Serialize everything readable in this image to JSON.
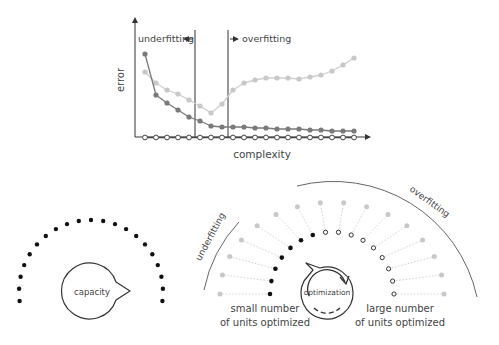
{
  "chart_data": {
    "type": "line",
    "title": "",
    "xlabel": "complexity",
    "ylabel": "error",
    "grid": false,
    "legend": null,
    "x": [
      1,
      2,
      3,
      4,
      5,
      6,
      7,
      8,
      9,
      10,
      11,
      12,
      13,
      14,
      15,
      16,
      17,
      18,
      19,
      20
    ],
    "series": [
      {
        "name": "training error (dark)",
        "color": "#7a7a7a",
        "values": [
          83,
          42,
          34,
          27,
          20,
          16,
          11,
          10,
          10,
          10,
          9,
          9,
          8,
          8,
          8,
          7,
          7,
          6,
          6,
          6
        ]
      },
      {
        "name": "validation error (light)",
        "color": "#c4c4c4",
        "values": [
          65,
          54,
          47,
          43,
          37,
          31,
          24,
          33,
          47,
          54,
          57,
          59,
          59,
          59,
          58,
          60,
          62,
          66,
          72,
          79
        ]
      },
      {
        "name": "baseline (open markers)",
        "color": "#555555",
        "values": [
          0,
          0,
          0,
          0,
          0,
          0,
          0,
          0,
          0,
          0,
          0,
          0,
          0,
          0,
          0,
          0,
          0,
          0,
          0,
          0
        ]
      }
    ],
    "annotations": [
      {
        "text": "underfitting",
        "arrow": "left",
        "at_x": 5.6
      },
      {
        "text": "overfitting",
        "arrow": "right",
        "at_x": 8.6
      }
    ]
  },
  "chart": {
    "ylabel": "error",
    "xlabel": "complexity",
    "underfitting_label": "underfitting",
    "overfitting_label": "overfitting"
  },
  "left_diagram": {
    "dot_count": 21,
    "bubble_label": "capacity"
  },
  "right_diagram": {
    "underfitting_label": "underfitting",
    "overfitting_label": "overfitting",
    "optimization_label": "optimization",
    "small_caption_line1": "small number",
    "small_caption_line2": "of units optimized",
    "large_caption_line1": "large number",
    "large_caption_line2": "of units optimized",
    "optimized_units_small": 7,
    "optimized_units_large": 8,
    "total_units": 16
  },
  "colors": {
    "axis": "#333333",
    "dark_series": "#7a7a7a",
    "light_series": "#c8c8c8",
    "black_dot": "#111111",
    "gray_dot": "#c8c8c8"
  }
}
